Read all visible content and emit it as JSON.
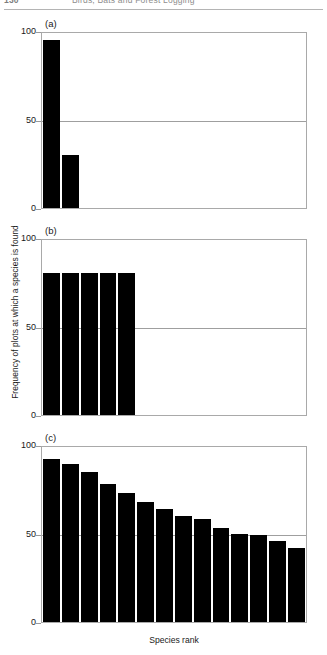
{
  "running_head": {
    "page_number": "130",
    "title": "Birds, Bats and Forest Logging"
  },
  "figure": {
    "ylabel": "Frequency of plots at which a species is found",
    "xlabel": "Species rank",
    "panel_tags": [
      "(a)",
      "(b)",
      "(c)"
    ],
    "ytick_labels": [
      "100",
      "50",
      "0"
    ]
  },
  "chart_data": [
    {
      "type": "bar",
      "panel": "(a)",
      "title": "",
      "xlabel": "Species rank",
      "ylabel": "Frequency of plots at which a species is found",
      "ylim": [
        0,
        100
      ],
      "yticks": [
        0,
        50,
        100
      ],
      "grid": true,
      "gridlines_at": [
        50
      ],
      "n_slots": 14,
      "categories": [
        1,
        2
      ],
      "values": [
        95,
        30
      ],
      "bar_color": "#000000"
    },
    {
      "type": "bar",
      "panel": "(b)",
      "title": "",
      "xlabel": "Species rank",
      "ylabel": "Frequency of plots at which a species is found",
      "ylim": [
        0,
        100
      ],
      "yticks": [
        0,
        50,
        100
      ],
      "grid": true,
      "gridlines_at": [
        50
      ],
      "n_slots": 14,
      "categories": [
        1,
        2,
        3,
        4,
        5
      ],
      "values": [
        80,
        80,
        80,
        80,
        80
      ],
      "bar_color": "#000000"
    },
    {
      "type": "bar",
      "panel": "(c)",
      "title": "",
      "xlabel": "Species rank",
      "ylabel": "Frequency of plots at which a species is found",
      "ylim": [
        0,
        100
      ],
      "yticks": [
        0,
        50,
        100
      ],
      "grid": true,
      "gridlines_at": [
        50
      ],
      "n_slots": 14,
      "categories": [
        1,
        2,
        3,
        4,
        5,
        6,
        7,
        8,
        9,
        10,
        11,
        12,
        13,
        14
      ],
      "values": [
        92,
        89,
        85,
        78,
        73,
        68,
        64,
        60,
        58,
        53,
        50,
        49,
        46,
        42,
        39
      ],
      "bar_color": "#000000"
    }
  ]
}
